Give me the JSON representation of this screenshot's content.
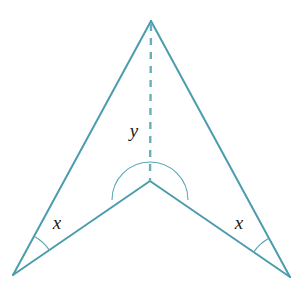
{
  "figure": {
    "background_color": "#ffffff",
    "stroke_color": "#4b9cad",
    "arc_color": "#5aa6b5",
    "label_color": "#1a1a1a",
    "stroke_width": 2,
    "arc_stroke_width": 1.1,
    "dash_pattern": "7 7"
  },
  "labels": {
    "angle_left": "x",
    "angle_right": "x",
    "angle_reflex": "y"
  },
  "geometry": {
    "points": {
      "apex": {
        "x": 151,
        "y": 21
      },
      "center": {
        "x": 150,
        "y": 181
      },
      "bottom_left": {
        "x": 13,
        "y": 275
      },
      "bottom_right": {
        "x": 290,
        "y": 277
      }
    },
    "edges": [
      {
        "name": "apex-to-bottom-left",
        "from": "apex",
        "to": "bottom_left"
      },
      {
        "name": "apex-to-bottom-right",
        "from": "apex",
        "to": "bottom_right"
      },
      {
        "name": "bottom-left-to-center",
        "from": "bottom_left",
        "to": "center"
      },
      {
        "name": "bottom-right-to-center",
        "from": "bottom_right",
        "to": "center"
      }
    ],
    "dashed_segment": {
      "name": "apex-to-center-axis",
      "from": "apex",
      "to": "center"
    },
    "reflex_arc": {
      "center": {
        "x": 150,
        "y": 181
      },
      "radius": 38,
      "start": {
        "x": 112,
        "y": 200
      },
      "end": {
        "x": 188,
        "y": 200
      },
      "sweep": "reflex-through-top"
    },
    "angle_arc_left": {
      "vertex": {
        "x": 13,
        "y": 275
      },
      "radius": 44
    },
    "angle_arc_right": {
      "vertex": {
        "x": 290,
        "y": 277
      },
      "radius": 44
    },
    "label_positions": {
      "angle_left": {
        "x": 57,
        "y": 229
      },
      "angle_right": {
        "x": 239,
        "y": 229
      },
      "angle_reflex": {
        "x": 134,
        "y": 137
      }
    }
  }
}
